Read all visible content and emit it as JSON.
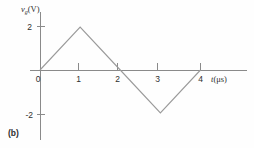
{
  "figure": {
    "panel_label": "(b)",
    "background_color": "#fefefe",
    "line_color": "#9a9a9a",
    "axis_color": "#8a8a8a"
  },
  "chart_data": {
    "type": "line",
    "title": "",
    "subtitle": "",
    "xlabel": "t(μs)",
    "xlabel_symbol": "t",
    "xlabel_unit": "(μs)",
    "ylabel": "v_g(V)",
    "ylabel_symbol": "v",
    "ylabel_subscript": "g",
    "ylabel_unit": "(V)",
    "x": [
      0,
      1,
      2,
      3,
      4
    ],
    "values": [
      0,
      2,
      0,
      -2,
      0
    ],
    "series": [
      {
        "name": "v_g",
        "x": [
          0,
          1,
          2,
          3,
          4
        ],
        "values": [
          0,
          2,
          0,
          -2,
          0
        ]
      }
    ],
    "xlim": [
      0,
      4.6
    ],
    "ylim": [
      -2.9,
      2.6
    ],
    "xticks": [
      0,
      1,
      2,
      3,
      4
    ],
    "xticklabels": [
      "0",
      "1",
      "2",
      "3",
      "4"
    ],
    "yticks": [
      2,
      0,
      -2
    ],
    "yticklabels": [
      "2",
      "0",
      "-2"
    ],
    "y_zero_label": "0",
    "y_pos_label": "2",
    "y_neg_label": "-2",
    "grid": false,
    "legend": null,
    "annotations": [],
    "waveform": "triangular",
    "peak_value": 2,
    "trough_value": -2,
    "period": 4
  }
}
